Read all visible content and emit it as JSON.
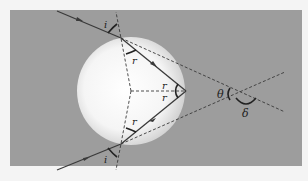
{
  "diagram": {
    "colors": {
      "page_background": "#f4f4f4",
      "panel_background": "#9d9d9d",
      "sphere_center": "#ffffff",
      "sphere_edge": "#d6d6d6",
      "ray": "#3a3a3a",
      "dashed": "#3a3a3a"
    },
    "labels": {
      "incident_angle_top": "i",
      "refracted_angle_top": "r",
      "reflection_angle_upper": "r",
      "reflection_angle_lower": "r",
      "refracted_angle_bottom": "r",
      "incident_angle_bottom": "i",
      "theta": "θ",
      "delta": "δ"
    },
    "elements": [
      "incoming ray",
      "refracted ray inside sphere",
      "reflected ray inside sphere",
      "outgoing ray",
      "surface normals (dashed)",
      "extended ray lines (dashed)",
      "angle arcs"
    ]
  }
}
